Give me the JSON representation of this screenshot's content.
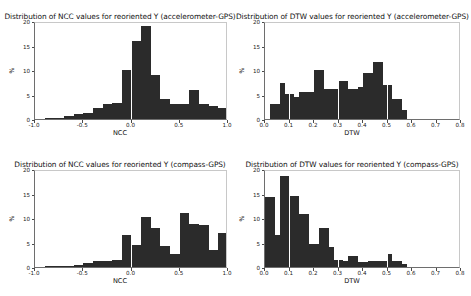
{
  "figure": {
    "background": "#ffffff",
    "bar_color": "#2b2b2b",
    "axis_color": "#6e6e6e"
  },
  "chart_data": [
    {
      "id": "ncc-accelerometer-gps",
      "type": "bar",
      "title": "Distribution of NCC values for reoriented Y (accelerometer-GPS)",
      "xlabel": "NCC",
      "ylabel": "%",
      "xlim": [
        -1.0,
        1.0
      ],
      "ylim": [
        0,
        20
      ],
      "grid": false,
      "legend": "none",
      "xticks": [
        -1.0,
        -0.5,
        0.0,
        0.5,
        1.0
      ],
      "xtick_labels": [
        "-1.0",
        "-0.5",
        "0.0",
        "0.5",
        "1.0"
      ],
      "yticks": [
        0,
        5,
        10,
        15,
        20
      ],
      "ytick_labels": [
        "0",
        "5",
        "10",
        "15",
        "20"
      ],
      "bin_edges": [
        -1.0,
        -0.9,
        -0.8,
        -0.7,
        -0.6,
        -0.5,
        -0.4,
        -0.3,
        -0.2,
        -0.1,
        0.0,
        0.1,
        0.2,
        0.3,
        0.4,
        0.5,
        0.6,
        0.7,
        0.8,
        0.9,
        1.0
      ],
      "values": [
        0.0,
        0.3,
        0.3,
        0.6,
        1.0,
        1.3,
        2.3,
        3.0,
        3.3,
        10.0,
        16.0,
        19.0,
        9.0,
        4.0,
        3.0,
        3.0,
        6.0,
        3.0,
        2.6,
        2.2
      ]
    },
    {
      "id": "dtw-accelerometer-gps",
      "type": "bar",
      "title": "Distribution of DTW values for reoriented Y (accelerometer-GPS)",
      "xlabel": "DTW",
      "ylabel": "%",
      "xlim": [
        0.0,
        0.8
      ],
      "ylim": [
        0,
        20
      ],
      "grid": false,
      "legend": "none",
      "xticks": [
        0.0,
        0.1,
        0.2,
        0.3,
        0.4,
        0.5,
        0.6,
        0.7,
        0.8
      ],
      "xtick_labels": [
        "0.0",
        "0.1",
        "0.2",
        "0.3",
        "0.4",
        "0.5",
        "0.6",
        "0.7",
        "0.8"
      ],
      "yticks": [
        0,
        5,
        10,
        15,
        20
      ],
      "ytick_labels": [
        "0",
        "5",
        "10",
        "15",
        "20"
      ],
      "bin_edges": [
        0.0,
        0.02,
        0.04,
        0.06,
        0.08,
        0.1,
        0.12,
        0.14,
        0.16,
        0.18,
        0.2,
        0.22,
        0.24,
        0.26,
        0.28,
        0.3,
        0.32,
        0.34,
        0.36,
        0.38,
        0.4,
        0.42,
        0.44,
        0.46,
        0.48,
        0.5,
        0.52,
        0.54,
        0.56,
        0.58,
        0.6
      ],
      "values": [
        0.0,
        3.0,
        3.0,
        7.4,
        5.2,
        5.2,
        4.4,
        5.6,
        5.6,
        5.6,
        10.0,
        10.0,
        6.1,
        6.1,
        6.1,
        7.8,
        7.8,
        6.1,
        6.1,
        6.5,
        9.3,
        9.3,
        11.7,
        11.7,
        7.0,
        7.0,
        4.0,
        4.0,
        1.8,
        0.0
      ]
    },
    {
      "id": "ncc-compass-gps",
      "type": "bar",
      "title": "Distribution of NCC values for reoriented Y (compass-GPS)",
      "xlabel": "NCC",
      "ylabel": "%",
      "xlim": [
        -1.0,
        1.0
      ],
      "ylim": [
        0,
        20
      ],
      "grid": false,
      "legend": "none",
      "xticks": [
        -1.0,
        -0.5,
        0.0,
        0.5,
        1.0
      ],
      "xtick_labels": [
        "-1.0",
        "-0.5",
        "0.0",
        "0.5",
        "1.0"
      ],
      "yticks": [
        0,
        5,
        10,
        15,
        20
      ],
      "ytick_labels": [
        "0",
        "5",
        "10",
        "15",
        "20"
      ],
      "bin_edges": [
        -1.0,
        -0.9,
        -0.8,
        -0.7,
        -0.6,
        -0.5,
        -0.4,
        -0.3,
        -0.2,
        -0.1,
        0.0,
        0.1,
        0.2,
        0.3,
        0.4,
        0.5,
        0.6,
        0.7,
        0.8,
        0.9,
        1.0
      ],
      "values": [
        0.0,
        0.2,
        0.2,
        0.3,
        0.5,
        0.9,
        1.2,
        1.2,
        1.5,
        6.5,
        4.5,
        10.3,
        8.0,
        4.2,
        2.7,
        11.1,
        8.8,
        8.6,
        3.5,
        7.0,
        15.0
      ]
    },
    {
      "id": "dtw-compass-gps",
      "type": "bar",
      "title": "Distribution of DTW values for reoriented Y (compass-GPS)",
      "xlabel": "DTW",
      "ylabel": "%",
      "xlim": [
        0.0,
        0.8
      ],
      "ylim": [
        0,
        20
      ],
      "grid": false,
      "legend": "none",
      "xticks": [
        0.0,
        0.1,
        0.2,
        0.3,
        0.4,
        0.5,
        0.6,
        0.7,
        0.8
      ],
      "xtick_labels": [
        "0.0",
        "0.1",
        "0.2",
        "0.3",
        "0.4",
        "0.5",
        "0.6",
        "0.7",
        "0.8"
      ],
      "yticks": [
        0,
        5,
        10,
        15,
        20
      ],
      "ytick_labels": [
        "0",
        "5",
        "10",
        "15",
        "20"
      ],
      "bin_edges": [
        0.0,
        0.02,
        0.04,
        0.06,
        0.08,
        0.1,
        0.12,
        0.14,
        0.16,
        0.18,
        0.2,
        0.22,
        0.24,
        0.26,
        0.28,
        0.3,
        0.32,
        0.34,
        0.36,
        0.38,
        0.4,
        0.42,
        0.44,
        0.46,
        0.48,
        0.5,
        0.52,
        0.54,
        0.56,
        0.58,
        0.6
      ],
      "values": [
        14.2,
        14.2,
        6.6,
        18.6,
        18.6,
        14.4,
        14.4,
        10.9,
        10.9,
        4.7,
        4.7,
        8.0,
        8.0,
        4.0,
        1.4,
        1.4,
        1.2,
        2.3,
        2.3,
        1.0,
        1.0,
        1.3,
        1.3,
        1.2,
        1.2,
        2.7,
        1.2,
        1.2,
        0.7,
        0.0
      ]
    }
  ]
}
